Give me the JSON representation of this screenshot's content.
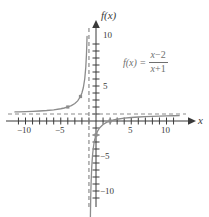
{
  "figure": {
    "title": "",
    "equation": {
      "lhs": "f(x)",
      "equals": "=",
      "numerator_var": "x",
      "numerator_op": "−",
      "numerator_const": "2",
      "denominator_var": "x",
      "denominator_op": "+",
      "denominator_const": "1",
      "plain": "f(x) = (x - 2)/(x + 1)"
    },
    "axis_labels": {
      "x": "x",
      "y": "f(x)"
    },
    "colors": {
      "curve": "#8c8c8c",
      "axis": "#3a3a3a",
      "asymptote": "#8c8c8c",
      "text": "#3a3a3a",
      "equation_text": "#6f6f6f",
      "background": "#ffffff"
    }
  },
  "chart_data": {
    "type": "line",
    "title": "",
    "subtitle": "",
    "xlabel": "x",
    "ylabel": "f(x)",
    "xlim": [
      -12,
      12
    ],
    "ylim": [
      -12,
      12
    ],
    "xticks": [
      -11,
      -10,
      -9,
      -8,
      -7,
      -6,
      -5,
      -4,
      -3,
      -2,
      -1,
      1,
      2,
      3,
      4,
      5,
      6,
      7,
      8,
      9,
      10,
      11
    ],
    "yticks": [
      -11,
      -10,
      -9,
      -8,
      -7,
      -6,
      -5,
      -4,
      -3,
      -2,
      -1,
      1,
      2,
      3,
      4,
      5,
      6,
      7,
      8,
      9,
      10,
      11
    ],
    "xtick_labels": [
      {
        "value": -10,
        "label": "−10"
      },
      {
        "value": -5,
        "label": "−5"
      },
      {
        "value": 5,
        "label": "5"
      },
      {
        "value": 10,
        "label": "10"
      }
    ],
    "ytick_labels": [
      {
        "value": 10,
        "label": "10"
      },
      {
        "value": 5,
        "label": "5"
      },
      {
        "value": -5,
        "label": "−5"
      },
      {
        "value": -10,
        "label": "−10"
      }
    ],
    "grid": false,
    "legend": null,
    "function": "f(x) = (x - 2)/(x + 1)",
    "asymptotes": [
      {
        "kind": "vertical",
        "value": -1,
        "style": "dashed",
        "label": "x = -1"
      },
      {
        "kind": "horizontal",
        "value": 1,
        "style": "dashed",
        "label": "f(x) = 1"
      }
    ],
    "intercepts": [
      {
        "kind": "x-intercept",
        "x": 2,
        "y": 0
      },
      {
        "kind": "y-intercept",
        "x": 0,
        "y": -2
      }
    ],
    "marked_points": [
      {
        "x": -4,
        "y": 2
      },
      {
        "x": -2.2,
        "y": 3.5
      },
      {
        "x": 0,
        "y": -2
      },
      {
        "x": 2,
        "y": 0
      }
    ],
    "series": [
      {
        "name": "left-branch",
        "points": [
          {
            "x": -11.5,
            "y": 1.3
          },
          {
            "x": -11.0,
            "y": 1.3
          },
          {
            "x": -10.0,
            "y": 1.333
          },
          {
            "x": -9.0,
            "y": 1.375
          },
          {
            "x": -8.0,
            "y": 1.4286
          },
          {
            "x": -7.0,
            "y": 1.5
          },
          {
            "x": -6.0,
            "y": 1.6
          },
          {
            "x": -5.0,
            "y": 1.75
          },
          {
            "x": -4.5,
            "y": 1.857
          },
          {
            "x": -4.0,
            "y": 2.0
          },
          {
            "x": -3.5,
            "y": 2.2
          },
          {
            "x": -3.0,
            "y": 2.5
          },
          {
            "x": -2.6,
            "y": 2.875
          },
          {
            "x": -2.2,
            "y": 3.5
          },
          {
            "x": -2.0,
            "y": 4.0
          },
          {
            "x": -1.8,
            "y": 4.75
          },
          {
            "x": -1.6,
            "y": 6.0
          },
          {
            "x": -1.45,
            "y": 7.667
          },
          {
            "x": -1.35,
            "y": 9.571
          },
          {
            "x": -1.3,
            "y": 11.0
          },
          {
            "x": -1.27,
            "y": 12.1
          }
        ]
      },
      {
        "name": "right-branch",
        "points": [
          {
            "x": -0.78,
            "y": -12.64
          },
          {
            "x": -0.8,
            "y": -14.0
          },
          {
            "x": -0.75,
            "y": -11.0
          },
          {
            "x": -0.7,
            "y": -9.0
          },
          {
            "x": -0.6,
            "y": -6.5
          },
          {
            "x": -0.5,
            "y": -5.0
          },
          {
            "x": -0.4,
            "y": -4.0
          },
          {
            "x": -0.3,
            "y": -3.286
          },
          {
            "x": -0.2,
            "y": -2.75
          },
          {
            "x": -0.1,
            "y": -2.333
          },
          {
            "x": 0.0,
            "y": -2.0
          },
          {
            "x": 0.25,
            "y": -1.4
          },
          {
            "x": 0.5,
            "y": -1.0
          },
          {
            "x": 1.0,
            "y": -0.5
          },
          {
            "x": 1.5,
            "y": -0.2
          },
          {
            "x": 2.0,
            "y": 0.0
          },
          {
            "x": 2.5,
            "y": 0.143
          },
          {
            "x": 3.0,
            "y": 0.25
          },
          {
            "x": 4.0,
            "y": 0.4
          },
          {
            "x": 5.0,
            "y": 0.5
          },
          {
            "x": 6.0,
            "y": 0.571
          },
          {
            "x": 7.0,
            "y": 0.625
          },
          {
            "x": 8.0,
            "y": 0.667
          },
          {
            "x": 9.0,
            "y": 0.7
          },
          {
            "x": 10.0,
            "y": 0.727
          },
          {
            "x": 11.0,
            "y": 0.75
          },
          {
            "x": 11.8,
            "y": 0.765
          }
        ]
      }
    ]
  }
}
